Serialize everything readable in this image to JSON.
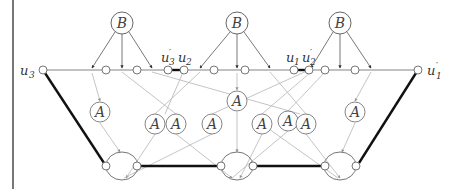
{
  "diagram": {
    "title": "",
    "colors": {
      "thin_edge": "#555555",
      "light_edge": "#b0b0b0",
      "bold_edge": "#111111",
      "node_stroke": "#555555",
      "frame_line": "#777777"
    },
    "b_nodes": [
      {
        "label": "B",
        "x": 122,
        "y": 23
      },
      {
        "label": "B",
        "x": 237,
        "y": 23
      },
      {
        "label": "B",
        "x": 340,
        "y": 23
      }
    ],
    "a_nodes": [
      {
        "label": "A",
        "x": 100,
        "y": 112
      },
      {
        "label": "A",
        "x": 155,
        "y": 124
      },
      {
        "label": "A",
        "x": 176,
        "y": 124
      },
      {
        "label": "A",
        "x": 237,
        "y": 101
      },
      {
        "label": "A",
        "x": 212,
        "y": 124
      },
      {
        "label": "A",
        "x": 262,
        "y": 124
      },
      {
        "label": "A",
        "x": 288,
        "y": 121
      },
      {
        "label": "A",
        "x": 306,
        "y": 124
      },
      {
        "label": "A",
        "x": 355,
        "y": 112
      }
    ],
    "terminal_labels": {
      "u3": "u",
      "u3_sub": "3",
      "u1p": "u",
      "u1p_sub": "1",
      "u1p_prime": "′",
      "u3p": "u",
      "u3p_sub": "3",
      "u3p_prime": "′",
      "u2": "u",
      "u2_sub": "2",
      "u1": "u",
      "u1_sub": "1",
      "u2p": "u",
      "u2p_sub": "2",
      "u2p_prime": "′"
    },
    "line_nodes_x": [
      106,
      137,
      168,
      184,
      214,
      245,
      294,
      309,
      325,
      355
    ],
    "bottom_gadgets": [
      {
        "cx": 122,
        "cy": 166,
        "left_x": 106,
        "right_x": 137
      },
      {
        "cx": 237,
        "cy": 166,
        "left_x": 221,
        "right_x": 253
      },
      {
        "cx": 340,
        "cy": 166,
        "left_x": 325,
        "right_x": 356
      }
    ]
  }
}
